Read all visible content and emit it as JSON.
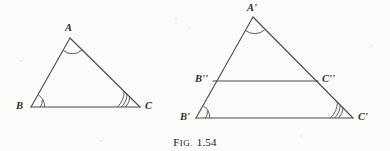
{
  "figure": {
    "caption_prefix": "Fig.",
    "caption_number": "1.54",
    "background_color": "#fbfbf9",
    "stroke_color": "#4a4a4a",
    "label_color": "#2e2e2e"
  },
  "triangles": [
    {
      "name": "triangle-abc",
      "vertices": [
        {
          "id": "A",
          "label": "A",
          "x": 70,
          "y": 38,
          "label_x": 65,
          "label_y": 23,
          "arcs": 1
        },
        {
          "id": "B",
          "label": "B",
          "x": 31,
          "y": 107,
          "label_x": 16,
          "label_y": 101,
          "arcs": 2
        },
        {
          "id": "C",
          "label": "C",
          "x": 140,
          "y": 107,
          "label_x": 145,
          "label_y": 101,
          "arcs": 3
        }
      ]
    },
    {
      "name": "triangle-a-prime-b-prime-c-prime",
      "vertices": [
        {
          "id": "A'",
          "label": "A'",
          "x": 253,
          "y": 17,
          "label_x": 247,
          "label_y": 3,
          "arcs": 1
        },
        {
          "id": "B'",
          "label": "B'",
          "x": 196,
          "y": 118,
          "label_x": 180,
          "label_y": 112,
          "arcs": 2
        },
        {
          "id": "C'",
          "label": "C'",
          "x": 353,
          "y": 118,
          "label_x": 358,
          "label_y": 112,
          "arcs": 3
        }
      ]
    }
  ],
  "interior_segment": {
    "name": "segment-b2-c2",
    "endpoints": [
      {
        "id": "B''",
        "label": "B''",
        "x": 213,
        "y": 81,
        "label_x": 195,
        "label_y": 74
      },
      {
        "id": "C''",
        "label": "C''",
        "x": 318,
        "y": 81,
        "label_x": 322,
        "label_y": 74
      }
    ]
  }
}
